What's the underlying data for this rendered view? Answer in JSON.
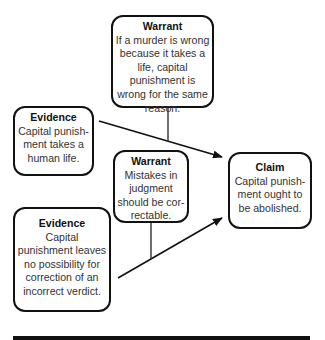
{
  "diagram": {
    "type": "toulmin-argument-map",
    "nodes": [
      {
        "id": "warrant_top",
        "title": "Warrant",
        "text": "If a murder is wrong because it takes a life, capital punishment is wrong for the same reason."
      },
      {
        "id": "evidence_1",
        "title": "Evidence",
        "text": "Capital punish-ment takes a human life."
      },
      {
        "id": "warrant_mid",
        "title": "Warrant",
        "text": "Mistakes in judgment should be cor-rectable."
      },
      {
        "id": "claim",
        "title": "Claim",
        "text": "Capital punish-ment ought to be abolished."
      },
      {
        "id": "evidence_2",
        "title": "Evidence",
        "text": "Capital punishment leaves no possibility for correction of an incorrect verdict."
      }
    ],
    "edges": [
      {
        "from": "evidence_1",
        "to": "claim",
        "style": "arrow"
      },
      {
        "from": "evidence_2",
        "to": "claim",
        "style": "arrow"
      },
      {
        "from": "warrant_top",
        "to": "edge:evidence_1->claim",
        "style": "line"
      },
      {
        "from": "warrant_mid",
        "to": "edge:evidence_2->claim",
        "style": "line"
      }
    ],
    "colors": {
      "stroke": "#111111",
      "background": "#ffffff",
      "text": "#333333"
    }
  }
}
